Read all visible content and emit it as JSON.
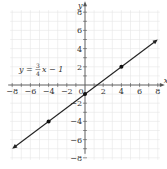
{
  "chart_data": {
    "type": "line",
    "title": "",
    "xlabel": "x",
    "ylabel": "y",
    "xlim": [
      -8,
      8
    ],
    "ylim": [
      -8,
      8
    ],
    "grid": true,
    "x_ticks": [
      -8,
      -6,
      -4,
      -2,
      0,
      2,
      4,
      6,
      8
    ],
    "y_ticks": [
      -8,
      -6,
      -4,
      -2,
      2,
      4,
      6,
      8
    ],
    "annotation": "y = 3/4 x − 1",
    "annotation_parts": {
      "lhs": "y =",
      "num": "3",
      "den": "4",
      "rhs": "x − 1"
    },
    "series": [
      {
        "name": "y = 3/4 x − 1",
        "slope": 0.75,
        "intercept": -1,
        "line_x_range": [
          -8,
          8
        ],
        "points": [
          {
            "x": -4,
            "y": -4
          },
          {
            "x": 0,
            "y": -1
          },
          {
            "x": 4,
            "y": 2
          }
        ]
      }
    ]
  }
}
